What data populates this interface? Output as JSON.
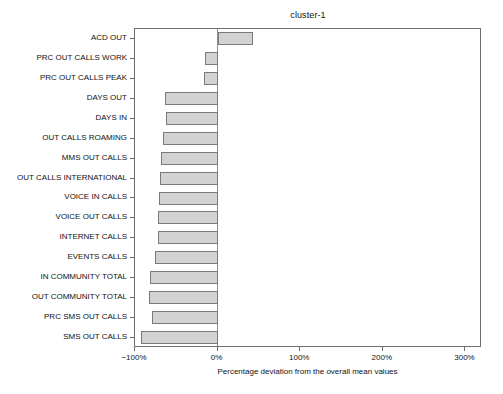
{
  "chart_data": {
    "type": "bar",
    "orientation": "horizontal",
    "title": "cluster-1",
    "xlabel": "Percentage deviation from the overall mean values",
    "ylabel": "",
    "xlim": [
      -100,
      320
    ],
    "xticks": [
      -100,
      0,
      100,
      200,
      300
    ],
    "xticklabels": [
      "−100%",
      "0%",
      "100%",
      "200%",
      "300%"
    ],
    "grid": false,
    "legend": null,
    "zero_reference_line": true,
    "bar_fill_color": "#d2d2d2",
    "bar_edge_color": "#7a7a7a",
    "categories": [
      "ACD OUT",
      "PRC OUT CALLS WORK",
      "PRC OUT CALLS PEAK",
      "DAYS OUT",
      "DAYS IN",
      "OUT CALLS ROAMING",
      "MMS OUT CALLS",
      "OUT CALLS INTERNATIONAL",
      "VOICE IN CALLS",
      "VOICE OUT CALLS",
      "INTERNET CALLS",
      "EVENTS CALLS",
      "IN COMMUNITY TOTAL",
      "OUT COMMUNITY TOTAL",
      "PRC SMS OUT CALLS",
      "SMS OUT CALLS"
    ],
    "values": [
      43,
      -15,
      -17,
      -64,
      -63,
      -66,
      -68,
      -70,
      -71,
      -72,
      -72,
      -76,
      -82,
      -83,
      -79,
      -93
    ]
  }
}
